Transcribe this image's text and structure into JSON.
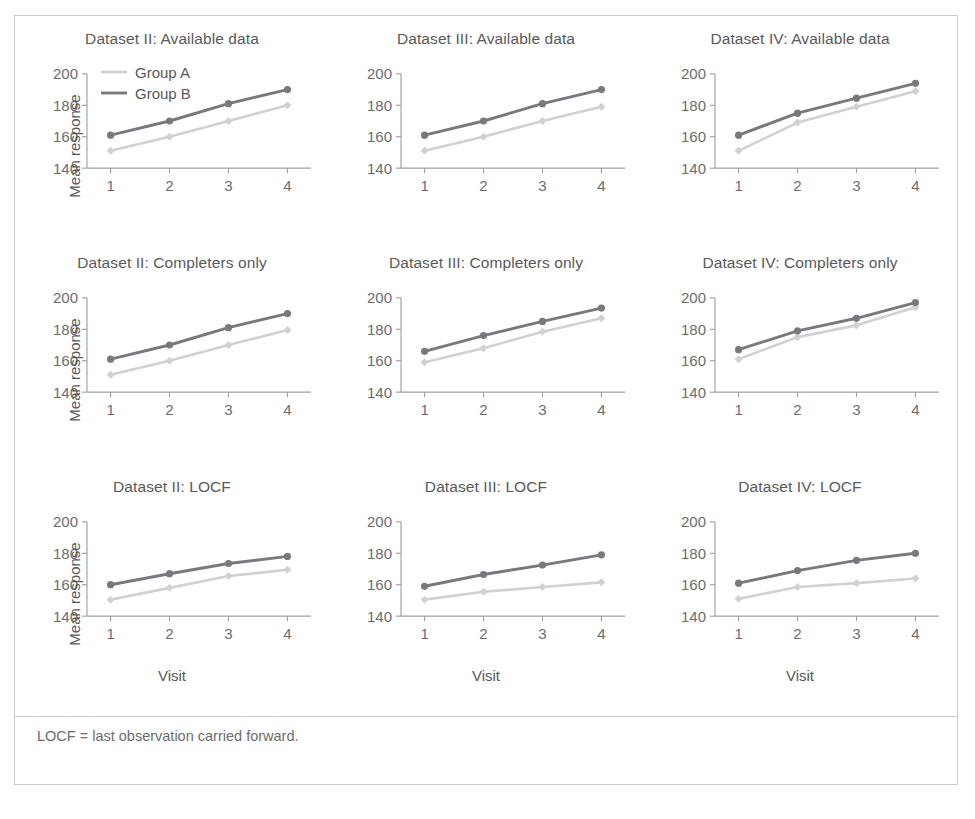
{
  "figure": {
    "footnote": "LOCF = last observation carried forward.",
    "axis_label_y": "Mean response",
    "axis_label_x": "Visit",
    "legend": {
      "series_a": "Group A",
      "series_b": "Group B"
    },
    "colors": {
      "series_a": "#cfd1d3",
      "series_b": "#77797c",
      "axis": "#9b9da0",
      "text": "#58595b",
      "frame": "#c9ccce"
    }
  },
  "chart_data": [
    {
      "type": "line",
      "title": "Dataset II: Available data",
      "xlabel": "Visit",
      "ylabel": "Mean response",
      "x": [
        1,
        2,
        3,
        4
      ],
      "xticklabels": [
        "1",
        "2",
        "3",
        "4"
      ],
      "yticks": [
        140,
        160,
        180,
        200
      ],
      "ylim": [
        135,
        205
      ],
      "xlim": [
        0.6,
        4.4
      ],
      "grid": false,
      "legend_position": "top-left",
      "series": [
        {
          "name": "Group A",
          "values": [
            151,
            160,
            170,
            180
          ],
          "marker": "diamond"
        },
        {
          "name": "Group B",
          "values": [
            161,
            170,
            181,
            190
          ],
          "marker": "circle"
        }
      ]
    },
    {
      "type": "line",
      "title": "Dataset III: Available data",
      "xlabel": "Visit",
      "ylabel": "Mean response",
      "x": [
        1,
        2,
        3,
        4
      ],
      "xticklabels": [
        "1",
        "2",
        "3",
        "4"
      ],
      "yticks": [
        140,
        160,
        180,
        200
      ],
      "ylim": [
        135,
        205
      ],
      "xlim": [
        0.6,
        4.4
      ],
      "grid": false,
      "legend_position": "none",
      "series": [
        {
          "name": "Group A",
          "values": [
            151,
            160,
            170,
            179
          ],
          "marker": "diamond"
        },
        {
          "name": "Group B",
          "values": [
            161,
            170,
            181,
            190
          ],
          "marker": "circle"
        }
      ]
    },
    {
      "type": "line",
      "title": "Dataset IV: Available data",
      "xlabel": "Visit",
      "ylabel": "Mean response",
      "x": [
        1,
        2,
        3,
        4
      ],
      "xticklabels": [
        "1",
        "2",
        "3",
        "4"
      ],
      "yticks": [
        140,
        160,
        180,
        200
      ],
      "ylim": [
        135,
        205
      ],
      "xlim": [
        0.6,
        4.4
      ],
      "grid": false,
      "legend_position": "none",
      "series": [
        {
          "name": "Group A",
          "values": [
            151,
            169,
            179,
            189
          ],
          "marker": "diamond"
        },
        {
          "name": "Group B",
          "values": [
            161,
            175,
            184.5,
            194
          ],
          "marker": "circle"
        }
      ]
    },
    {
      "type": "line",
      "title": "Dataset II: Completers only",
      "xlabel": "Visit",
      "ylabel": "Mean response",
      "x": [
        1,
        2,
        3,
        4
      ],
      "xticklabels": [
        "1",
        "2",
        "3",
        "4"
      ],
      "yticks": [
        140,
        160,
        180,
        200
      ],
      "ylim": [
        135,
        205
      ],
      "xlim": [
        0.6,
        4.4
      ],
      "grid": false,
      "legend_position": "none",
      "series": [
        {
          "name": "Group A",
          "values": [
            151,
            160,
            170,
            179.5
          ],
          "marker": "diamond"
        },
        {
          "name": "Group B",
          "values": [
            161,
            170,
            181,
            190
          ],
          "marker": "circle"
        }
      ]
    },
    {
      "type": "line",
      "title": "Dataset III: Completers only",
      "xlabel": "Visit",
      "ylabel": "Mean response",
      "x": [
        1,
        2,
        3,
        4
      ],
      "xticklabels": [
        "1",
        "2",
        "3",
        "4"
      ],
      "yticks": [
        140,
        160,
        180,
        200
      ],
      "ylim": [
        135,
        205
      ],
      "xlim": [
        0.6,
        4.4
      ],
      "grid": false,
      "legend_position": "none",
      "series": [
        {
          "name": "Group A",
          "values": [
            159,
            168,
            178.5,
            187
          ],
          "marker": "diamond"
        },
        {
          "name": "Group B",
          "values": [
            166,
            176,
            185,
            193.5
          ],
          "marker": "circle"
        }
      ]
    },
    {
      "type": "line",
      "title": "Dataset IV: Completers only",
      "xlabel": "Visit",
      "ylabel": "Mean response",
      "x": [
        1,
        2,
        3,
        4
      ],
      "xticklabels": [
        "1",
        "2",
        "3",
        "4"
      ],
      "yticks": [
        140,
        160,
        180,
        200
      ],
      "ylim": [
        135,
        205
      ],
      "xlim": [
        0.6,
        4.4
      ],
      "grid": false,
      "legend_position": "none",
      "series": [
        {
          "name": "Group A",
          "values": [
            161,
            175,
            182.5,
            194
          ],
          "marker": "diamond"
        },
        {
          "name": "Group B",
          "values": [
            167,
            179,
            187,
            197
          ],
          "marker": "circle"
        }
      ]
    },
    {
      "type": "line",
      "title": "Dataset II: LOCF",
      "xlabel": "Visit",
      "ylabel": "Mean response",
      "x": [
        1,
        2,
        3,
        4
      ],
      "xticklabels": [
        "1",
        "2",
        "3",
        "4"
      ],
      "yticks": [
        140,
        160,
        180,
        200
      ],
      "ylim": [
        135,
        205
      ],
      "xlim": [
        0.6,
        4.4
      ],
      "grid": false,
      "legend_position": "none",
      "series": [
        {
          "name": "Group A",
          "values": [
            150.5,
            158,
            165.5,
            169.5
          ],
          "marker": "diamond"
        },
        {
          "name": "Group B",
          "values": [
            160,
            167,
            173.5,
            178
          ],
          "marker": "circle"
        }
      ]
    },
    {
      "type": "line",
      "title": "Dataset III: LOCF",
      "xlabel": "Visit",
      "ylabel": "Mean response",
      "x": [
        1,
        2,
        3,
        4
      ],
      "xticklabels": [
        "1",
        "2",
        "3",
        "4"
      ],
      "yticks": [
        140,
        160,
        180,
        200
      ],
      "ylim": [
        135,
        205
      ],
      "xlim": [
        0.6,
        4.4
      ],
      "grid": false,
      "legend_position": "none",
      "series": [
        {
          "name": "Group A",
          "values": [
            150.5,
            155.5,
            158.5,
            161.5
          ],
          "marker": "diamond"
        },
        {
          "name": "Group B",
          "values": [
            159,
            166.5,
            172.5,
            179
          ],
          "marker": "circle"
        }
      ]
    },
    {
      "type": "line",
      "title": "Dataset IV: LOCF",
      "xlabel": "Visit",
      "ylabel": "Mean response",
      "x": [
        1,
        2,
        3,
        4
      ],
      "xticklabels": [
        "1",
        "2",
        "3",
        "4"
      ],
      "yticks": [
        140,
        160,
        180,
        200
      ],
      "ylim": [
        135,
        205
      ],
      "xlim": [
        0.6,
        4.4
      ],
      "grid": false,
      "legend_position": "none",
      "series": [
        {
          "name": "Group A",
          "values": [
            151,
            158.5,
            161,
            164
          ],
          "marker": "diamond"
        },
        {
          "name": "Group B",
          "values": [
            161,
            169,
            175.5,
            180
          ],
          "marker": "circle"
        }
      ]
    }
  ]
}
